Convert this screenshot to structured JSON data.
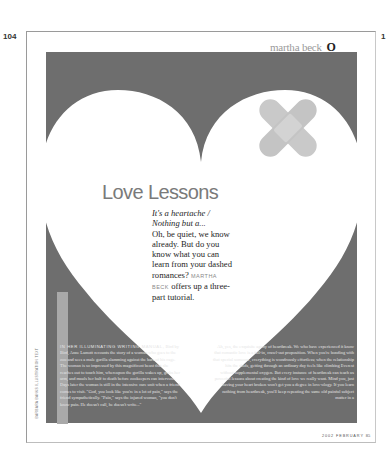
{
  "spread": {
    "left_page_number": "104",
    "right_page_number": "1"
  },
  "running_head": {
    "author": "martha beck",
    "logo": "O"
  },
  "article": {
    "title": "Love Lessons",
    "deck_italic": "It's a heartache / Nothing but a...",
    "deck_body": "Oh, be quiet, we know already. But do you know what you can learn from your dashed romances?",
    "byline": "MARTHA BECK",
    "deck_tail": "offers up a three-part tutorial.",
    "left_column_lead": "IN HER ILLUMINATING WRITING MANUAL,",
    "left_column_text": "Bird by Bird, Anne Lamott recounts the story of a woman who goes to the zoo and sees a male gorilla slamming against the bars of his cage. The woman is so impressed by this magnificent beast that she reaches out to touch him, whereupon the gorilla wakes up, grabs her arm, and mauls her half to death before zookeepers can intervene. Days later the woman is still in the intensive care unit when a friend comes to visit. \"God, you look like you're in a lot of pain,\" says the friend sympathetically. \"Pain,\" says the injured woman, \"you don't know pain. He doesn't call, he doesn't write...\"",
    "right_column_text": "Ah, yes, the exquisite agony of heartbreak. We who have experienced it know that romantic love is a fall-in, crawl-out proposition. When you're bonding with that special someone, everything is wondrously effortless; when the relationship hits the skids, getting through an ordinary day feels like climbing Everest without supplemental oxygen. But every instance of heartbreak can teach us powerful lessons about creating the kind of love we really want. Mind you, just having your heart broken won't get you a degree in love-ology. If you learn nothing from heartbreak, you'll keep repeating the same old painful subject matter in a",
    "photo_credit": "BARBARA BANKS ILLUSTRATION TEXT"
  },
  "folio": {
    "label": "2002 FEBRUARY",
    "page": "85"
  },
  "colors": {
    "panel_gray": "#6e6e6e",
    "heart_white": "#ffffff",
    "bandage": "#c6c6c6",
    "title_gray": "#7a7a7a"
  }
}
